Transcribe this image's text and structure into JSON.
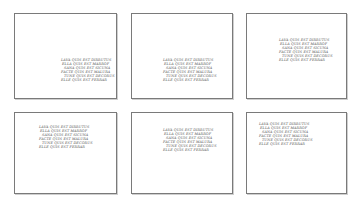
{
  "panels": [
    {
      "id": 1,
      "lines": [
        "Lava quis est dirrutus",
        "Ella quis est marrof",
        "Sana quis est sicuna",
        "Facte quis est malura",
        "Tune quis est decorus",
        "Elle quis est ferrar"
      ]
    },
    {
      "id": 2,
      "lines": [
        "Lava quis est dirrutus",
        "Ella quis est marrof",
        "Sana quis est sicuna",
        "Facte quis est malura",
        "Tune quis est decorus",
        "Elle quis est ferrar"
      ]
    },
    {
      "id": 3,
      "lines": [
        "Lava quis est dirrutus",
        "Ella quis est marrof",
        "Sana quis est sicuna",
        "Facte quis est malura",
        "Tune quis est decorus",
        "Elle quis est ferrar"
      ]
    },
    {
      "id": 4,
      "lines": [
        "Lava quis est dirrutus",
        "Ella quis est marrof",
        "Sana quis est sicuna",
        "Facte quis est malura",
        "Tune quis est decorus",
        "Elle quis est ferrar"
      ]
    },
    {
      "id": 5,
      "lines": [
        "Lava quis est dirrutus",
        "Ella quis est marrof",
        "Sana quis est sicuna",
        "Facte quis est malura",
        "Tune quis est decorus",
        "Elle quis est ferrar"
      ]
    },
    {
      "id": 6,
      "lines": [
        "Lava quis est dirrutus",
        "Ella quis est marrof",
        "Sana quis est sicuna",
        "Facte quis est malura",
        "Tune quis est decorus",
        "Elle quis est ferrar"
      ]
    }
  ]
}
